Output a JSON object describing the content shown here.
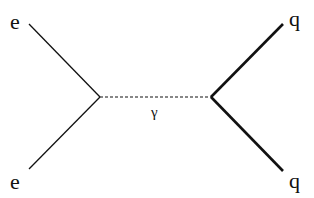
{
  "diagram": {
    "type": "feynman",
    "labels": {
      "incoming_top": "e",
      "incoming_bottom": "e",
      "outgoing_top": "q",
      "outgoing_bottom": "q",
      "propagator": "γ"
    },
    "vertices": {
      "left": [
        100,
        97
      ],
      "right": [
        211,
        97
      ]
    },
    "colors": {
      "line": "#111111",
      "background": "#ffffff"
    }
  }
}
